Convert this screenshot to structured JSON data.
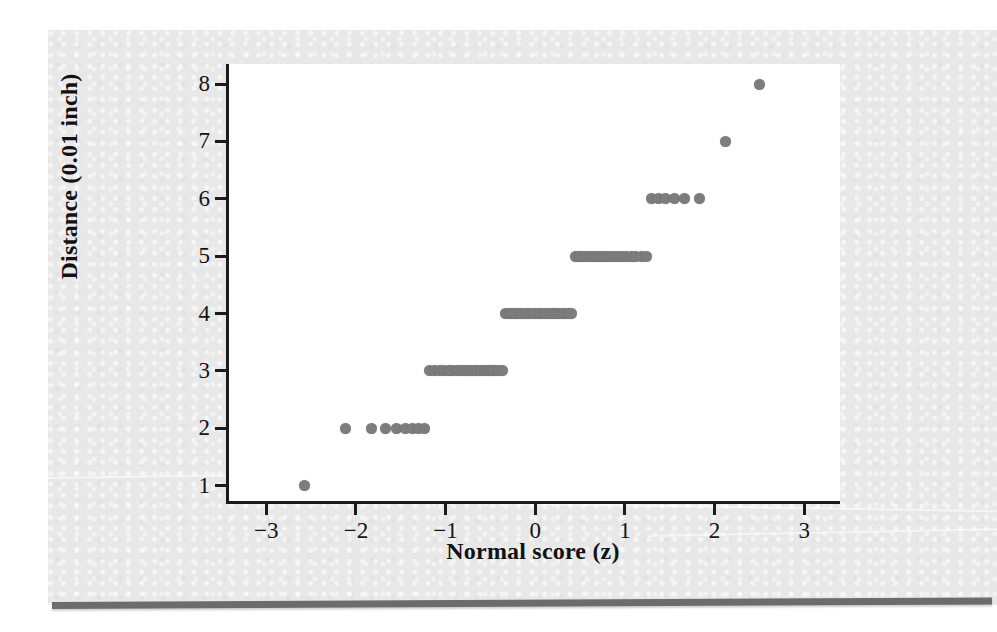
{
  "figure": {
    "kind": "normal-probability-plot",
    "background_color": "#e8e8e8",
    "plot_background_color": "#ffffff",
    "axis_color": "#1b1b1b",
    "rule_color": "#6b6b70"
  },
  "chart_data": {
    "type": "scatter",
    "title": "",
    "xlabel": "Normal score (z)",
    "ylabel": "Distance (0.01 inch)",
    "xlim": [
      -3.45,
      3.4
    ],
    "ylim": [
      0.68,
      8.35
    ],
    "xticks": [
      -3,
      -2,
      -1,
      0,
      1,
      2,
      3
    ],
    "xticklabels": [
      "−3",
      "−2",
      "−1",
      "0",
      "1",
      "2",
      "3"
    ],
    "yticks": [
      1,
      2,
      3,
      4,
      5,
      6,
      7,
      8
    ],
    "yticklabels": [
      "1",
      "2",
      "3",
      "4",
      "5",
      "6",
      "7",
      "8"
    ],
    "grid": false,
    "legend": null,
    "marker": {
      "shape": "circle",
      "color": "#7d7d7d",
      "size_px": 11
    },
    "series": [
      {
        "name": "Distance vs normal score",
        "x": [
          -2.57,
          -2.12,
          -1.83,
          -1.67,
          -1.55,
          -1.45,
          -1.37,
          -1.3,
          -1.24,
          -1.18,
          -1.12,
          -1.07,
          -1.02,
          -0.97,
          -0.93,
          -0.88,
          -0.84,
          -0.8,
          -0.76,
          -0.72,
          -0.68,
          -0.64,
          -0.6,
          -0.56,
          -0.52,
          -0.49,
          -0.45,
          -0.41,
          -0.37,
          -0.33,
          -0.29,
          -0.25,
          -0.22,
          -0.18,
          -0.14,
          -0.1,
          -0.06,
          -0.02,
          0.02,
          0.06,
          0.1,
          0.14,
          0.18,
          0.22,
          0.25,
          0.29,
          0.33,
          0.37,
          0.41,
          0.45,
          0.49,
          0.52,
          0.56,
          0.6,
          0.64,
          0.68,
          0.72,
          0.76,
          0.8,
          0.84,
          0.88,
          0.93,
          0.97,
          1.02,
          1.07,
          1.12,
          1.18,
          1.24,
          1.3,
          1.37,
          1.45,
          1.55,
          1.67,
          1.83,
          2.12,
          2.5
        ],
        "y": [
          1,
          2,
          2,
          2,
          2,
          2,
          2,
          2,
          2,
          3,
          3,
          3,
          3,
          3,
          3,
          3,
          3,
          3,
          3,
          3,
          3,
          3,
          3,
          3,
          3,
          3,
          3,
          3,
          3,
          4,
          4,
          4,
          4,
          4,
          4,
          4,
          4,
          4,
          4,
          4,
          4,
          4,
          4,
          4,
          4,
          4,
          4,
          4,
          4,
          5,
          5,
          5,
          5,
          5,
          5,
          5,
          5,
          5,
          5,
          5,
          5,
          5,
          5,
          5,
          5,
          5,
          5,
          5,
          6,
          6,
          6,
          6,
          6,
          6,
          7,
          8
        ]
      }
    ]
  }
}
